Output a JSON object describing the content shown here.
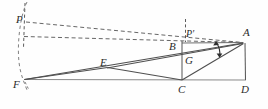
{
  "figure": {
    "kind": "geometry-diagram",
    "width": 268,
    "height": 109,
    "colors": {
      "stroke": "#3a3a3a",
      "light_stroke": "#8a8a8a",
      "dashed_stroke": "#5a5a5a",
      "label": "#2b2b2b",
      "background": "#fefefe"
    },
    "labels": [
      {
        "name": "point-label-P",
        "text": "P",
        "x": 16,
        "y": 14,
        "italic": true
      },
      {
        "name": "point-label-Pprime",
        "text": "P′",
        "x": 186,
        "y": 28,
        "italic": true
      },
      {
        "name": "point-label-A",
        "text": "A",
        "x": 243,
        "y": 27,
        "italic": true
      },
      {
        "name": "point-label-B",
        "text": "B",
        "x": 169,
        "y": 41,
        "italic": true
      },
      {
        "name": "point-label-G",
        "text": "G",
        "x": 185,
        "y": 55,
        "italic": true
      },
      {
        "name": "point-label-E",
        "text": "E",
        "x": 100,
        "y": 57,
        "italic": true
      },
      {
        "name": "point-label-F",
        "text": "F",
        "x": 13,
        "y": 79,
        "italic": true
      },
      {
        "name": "point-label-C",
        "text": "C",
        "x": 178,
        "y": 84,
        "italic": true
      },
      {
        "name": "point-label-D",
        "text": "D",
        "x": 241,
        "y": 84,
        "italic": true
      }
    ],
    "points": {
      "P": {
        "x": 24,
        "y": 22
      },
      "Pprime": {
        "x": 186,
        "y": 36
      },
      "A": {
        "x": 243,
        "y": 43
      },
      "B": {
        "x": 182,
        "y": 43
      },
      "G": {
        "x": 182,
        "y": 60
      },
      "E": {
        "x": 107,
        "y": 68
      },
      "F": {
        "x": 24,
        "y": 79
      },
      "C": {
        "x": 182,
        "y": 80
      },
      "D": {
        "x": 245,
        "y": 80
      }
    },
    "solid_segments": [
      {
        "name": "segment-B-A",
        "from": "B",
        "to": "A"
      },
      {
        "name": "segment-B-C",
        "from": "B",
        "to": "C"
      },
      {
        "name": "segment-C-D",
        "from": "C",
        "to": "D"
      },
      {
        "name": "segment-D-A",
        "from": "D",
        "to": "A"
      },
      {
        "name": "segment-F-C",
        "from": "F",
        "to": "C"
      },
      {
        "name": "segment-C-D-base",
        "from": "C",
        "to": "D"
      },
      {
        "name": "segment-F-A",
        "from": "F",
        "to": "A"
      },
      {
        "name": "segment-F-E",
        "from": "F",
        "to": "E"
      },
      {
        "name": "segment-E-C",
        "from": "E",
        "to": "C"
      },
      {
        "name": "segment-E-A",
        "from": "E",
        "to": "A"
      },
      {
        "name": "segment-C-A",
        "from": "C",
        "to": "A"
      }
    ],
    "dashed_segments": [
      {
        "name": "dashed-P-A",
        "from": "P",
        "to": "A"
      },
      {
        "name": "dashed-Pprime-A",
        "from": "Pprime",
        "to": "A"
      },
      {
        "name": "dashed-P-vertical",
        "from": "P-top",
        "to": "P-bottom"
      },
      {
        "name": "dashed-Pprime-vertical",
        "from": "Pprime-top",
        "to": "Pprime-bottom"
      },
      {
        "name": "dashed-arc-left",
        "from": "arc-top",
        "to": "arc-bottom"
      },
      {
        "name": "dashed-F-tick",
        "from": "F",
        "to": "F-tick"
      }
    ],
    "angle_marks": [
      {
        "name": "angle-mark-at-A",
        "description": "double-headed arrow arc between CA and EA at vertex A"
      }
    ]
  }
}
